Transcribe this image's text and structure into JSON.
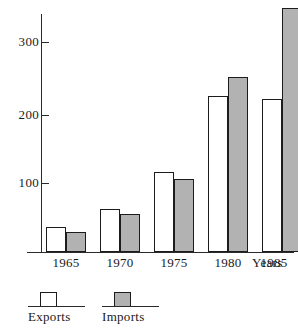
{
  "chart_data": {
    "type": "bar",
    "title": "",
    "xlabel": "Years",
    "ylabel": "",
    "categories": [
      "1965",
      "1970",
      "1975",
      "1980",
      "1985"
    ],
    "series": [
      {
        "name": "Exports",
        "color": "#ffffff",
        "values": [
          36,
          61,
          115,
          223,
          218
        ]
      },
      {
        "name": "Imports",
        "color": "#b2b2b2",
        "values": [
          29,
          54,
          104,
          250,
          348
        ]
      }
    ],
    "ylim": [
      0,
      360
    ],
    "yticks": [
      100,
      200,
      300
    ],
    "ytick_labels": [
      "100",
      "200",
      "300"
    ],
    "grid": false,
    "legend_position": "bottom-left",
    "legend": [
      "Exports",
      "Imports"
    ]
  },
  "axis": {
    "x_title": "Years",
    "tick_labels": [
      "300",
      "200",
      "100"
    ]
  },
  "legend": {
    "items": [
      {
        "label": "Exports",
        "swatch": "white-bar-swatch"
      },
      {
        "label": "Imports",
        "swatch": "gray-bar-swatch"
      }
    ]
  },
  "x_labels": [
    "1965",
    "1970",
    "1975",
    "1980",
    "1985"
  ],
  "colors": {
    "exports_fill": "#ffffff",
    "imports_fill": "#b2b2b2",
    "outline": "#1c1c1c",
    "axis": "#2a2a2a",
    "background": "#ffffff"
  }
}
